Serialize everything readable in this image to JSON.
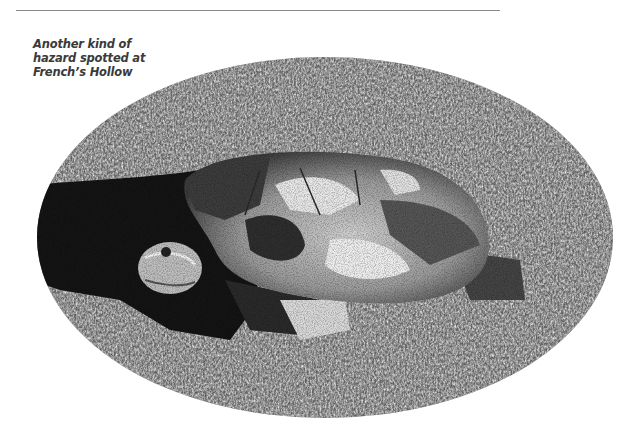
{
  "caption": {
    "lines": [
      "Another kind of",
      "hazard spotted at",
      "French’s Hollow"
    ]
  },
  "photo": {
    "subject": "turtle on grass",
    "shape": "ellipse",
    "tone": "black-and-white"
  },
  "colors": {
    "rule": "#8a8a8a",
    "caption_text": "#3a3a3a",
    "background": "#ffffff"
  }
}
